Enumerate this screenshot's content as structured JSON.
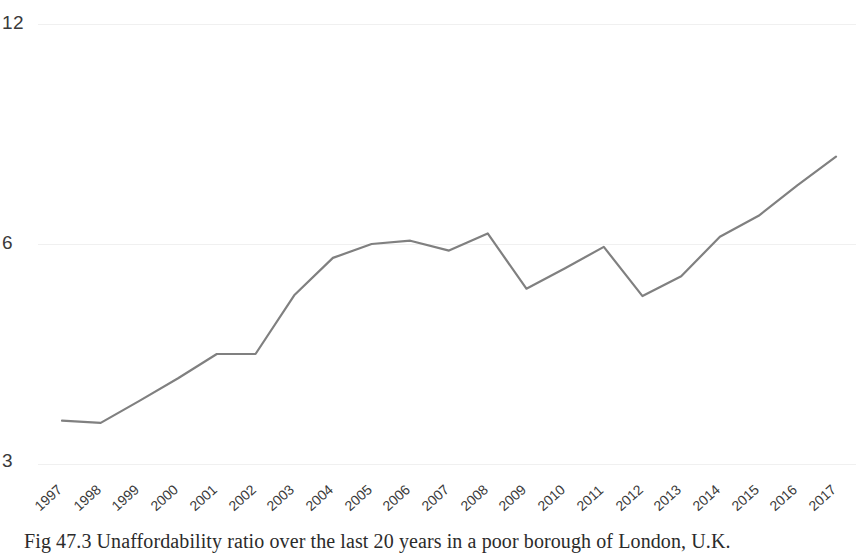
{
  "caption": "Fig 47.3 Unaffordability ratio over the last 20 years in a poor borough of London, U.K.",
  "axis": {
    "y_ticks": [
      "12",
      "6",
      "3"
    ],
    "x_label": "",
    "y_label": ""
  },
  "colors": {
    "line": "#808080",
    "grid": "#f0f0f0",
    "text": "#3a3a3a",
    "background": "#ffffff"
  },
  "chart_data": {
    "type": "line",
    "title": "",
    "subtitle": "",
    "xlabel": "",
    "ylabel": "",
    "grid": true,
    "legend": null,
    "ylim": [
      3,
      12
    ],
    "ytick_values": [
      12,
      6,
      3
    ],
    "note": "Y axis is non-uniformly spaced: equal pixel spans separate 3-6 and 6-12.",
    "categories": [
      "1997",
      "1998",
      "1999",
      "2000",
      "2001",
      "2002",
      "2003",
      "2004",
      "2005",
      "2006",
      "2007",
      "2008",
      "2009",
      "2010",
      "2011",
      "2012",
      "2013",
      "2014",
      "2015",
      "2016",
      "2017"
    ],
    "x": [
      1997,
      1998,
      1999,
      2000,
      2001,
      2002,
      2003,
      2004,
      2005,
      2006,
      2007,
      2008,
      2009,
      2010,
      2011,
      2012,
      2013,
      2014,
      2015,
      2016,
      2017
    ],
    "values": [
      3.59,
      3.56,
      3.86,
      4.17,
      4.5,
      4.5,
      5.3,
      5.81,
      6.0,
      6.09,
      5.91,
      6.29,
      5.39,
      5.67,
      5.96,
      5.29,
      5.56,
      6.2,
      6.77,
      7.6,
      8.38
    ],
    "series": [
      {
        "name": "Unaffordability ratio",
        "values": [
          3.59,
          3.56,
          3.86,
          4.17,
          4.5,
          4.5,
          5.3,
          5.81,
          6.0,
          6.09,
          5.91,
          6.29,
          5.39,
          5.67,
          5.96,
          5.29,
          5.56,
          6.2,
          6.77,
          7.6,
          8.38
        ]
      }
    ],
    "pixel_points": [
      [
        62,
        421
      ],
      [
        100,
        423
      ],
      [
        138,
        401
      ],
      [
        176,
        378
      ],
      [
        215,
        354
      ],
      [
        253,
        354
      ],
      [
        291,
        315
      ],
      [
        329,
        278
      ],
      [
        367,
        258
      ],
      [
        405,
        237
      ],
      [
        452,
        251
      ],
      [
        489,
        223
      ],
      [
        528,
        291
      ],
      [
        566,
        269
      ],
      [
        604,
        247
      ],
      [
        642,
        296
      ],
      [
        680,
        275
      ],
      [
        718,
        228
      ],
      [
        756,
        186
      ],
      [
        795,
        125
      ],
      [
        836,
        69
      ]
    ]
  }
}
